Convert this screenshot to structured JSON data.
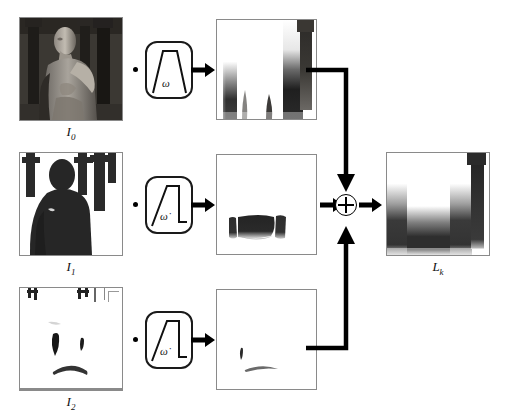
{
  "diagram": {
    "type": "signal-flow-block-diagram",
    "title_visible": false,
    "background_color": "#ffffff",
    "line_color": "#000000",
    "frame_border_color": "#8a8a8a"
  },
  "rows": [
    {
      "id": "row-0",
      "input_label": "I",
      "input_sub": "0",
      "input_label_full": "I0",
      "input_image_desc": "grayscale rendered 3D humanoid figure in dark pillared hall",
      "operator": "multiply-dot",
      "filter": {
        "symbol": "ω",
        "symbol_name": "omega",
        "shape": "trapezoid",
        "box_shape": "rounded-rect"
      },
      "arrow": "right-arrow",
      "output_image_desc": "blurred vertical dark gradient bands on white",
      "output_label": ""
    },
    {
      "id": "row-1",
      "input_label": "I",
      "input_sub": "1",
      "input_label_full": "I1",
      "input_image_desc": "high-contrast binary silhouette of figure and pillars",
      "operator": "multiply-dot",
      "filter": {
        "symbol": "ω̇",
        "symbol_name": "omega-dot",
        "shape": "ramp-plateau",
        "box_shape": "rounded-rect"
      },
      "arrow": "right-arrow",
      "output_image_desc": "small dark horizontal blobs near lower center on white",
      "output_label": ""
    },
    {
      "id": "row-2",
      "input_label": "I",
      "input_sub": "2",
      "input_label_full": "I2",
      "input_image_desc": "mostly white sparse outline image with small dark marks",
      "operator": "multiply-dot",
      "filter": {
        "symbol": "ω̇",
        "symbol_name": "omega-dot",
        "shape": "ramp-plateau",
        "box_shape": "rounded-rect"
      },
      "arrow": "right-arrow",
      "output_image_desc": "nearly blank white with faint thin marks",
      "output_label": ""
    }
  ],
  "adder": {
    "symbol": "⊕",
    "name": "circled-plus",
    "inputs": [
      "from-row-0-top",
      "from-row-1-left",
      "from-row-2-bottom"
    ],
    "outputs": [
      "to-result"
    ]
  },
  "result": {
    "label": "L",
    "label_sub": "k",
    "label_full": "Lk",
    "image_desc": "combined blurred result, dark band along bottom and right pillar"
  }
}
